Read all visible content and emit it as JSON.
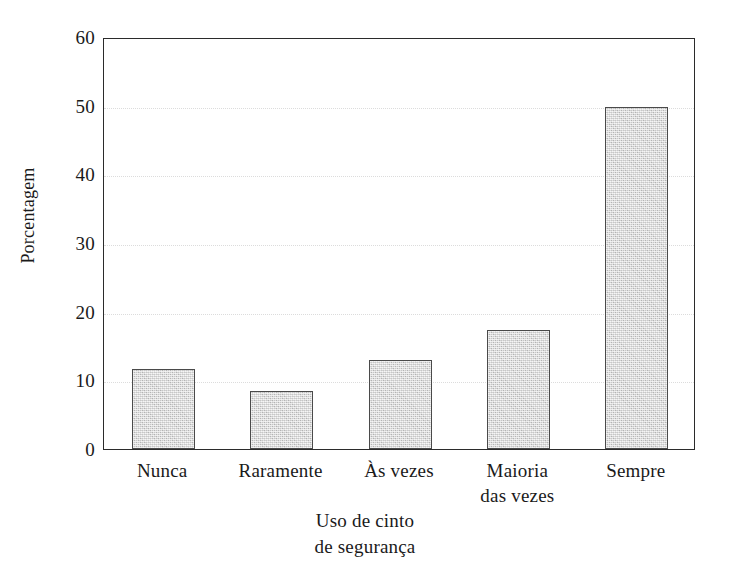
{
  "chart_data": {
    "type": "bar",
    "title": "",
    "subtitle": "",
    "categories": [
      "Nunca",
      "Raramente",
      "Às vezes",
      "Maioria\ndas vezes",
      "Sempre"
    ],
    "values": [
      11.7,
      8.5,
      13.0,
      17.4,
      49.8
    ],
    "xlabel": "Uso de cinto\nde segurança",
    "ylabel": "Porcentagem",
    "ylim": [
      0,
      60
    ],
    "ytick_labels": [
      "0",
      "10",
      "20",
      "30",
      "40",
      "50",
      "60"
    ],
    "ytick_values": [
      0,
      10,
      20,
      30,
      40,
      50,
      60
    ],
    "yminor_tick_values": [
      5,
      15,
      25,
      35,
      45,
      55
    ],
    "grid": "horizontal-major-dotted",
    "legend": "none",
    "bar_fill_color": "#cccccc",
    "bar_edge_color": "#4a4a4a",
    "frame_color": "#2b2b2b",
    "gridline_color": "#dcdcdc",
    "background_color": "#ffffff"
  }
}
